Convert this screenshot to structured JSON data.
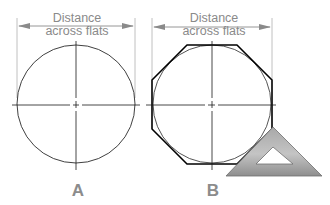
{
  "figures": [
    {
      "id": "A",
      "label": "A",
      "dimension_line1": "Distance",
      "dimension_line2": "across flats",
      "shape": "circle",
      "center": [
        76,
        104
      ],
      "radius": 59
    },
    {
      "id": "B",
      "label": "B",
      "dimension_line1": "Distance",
      "dimension_line2": "across flats",
      "shape": "circle with circumscribed octagon",
      "center": [
        212,
        104
      ],
      "radius": 59,
      "tool": "45-degree triangle"
    }
  ],
  "colors": {
    "dimension": "#8a8a8a",
    "outline": "#1a1a1a",
    "octagon": "#000000",
    "triangle_fill": "#9e9e9e",
    "label": "#8c8c8c"
  }
}
